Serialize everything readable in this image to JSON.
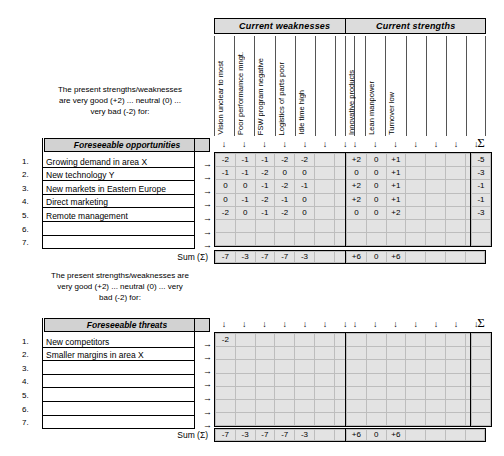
{
  "chart_data": {
    "type": "table",
    "groups": [
      {
        "name": "Current weaknesses",
        "columns": [
          "Vision unclear to most",
          "Poor performamce mngt.",
          "FSW program negative",
          "Logistics of parts  poor",
          "Idle time high",
          "",
          ""
        ],
        "column_count": 7
      },
      {
        "name": "Current strengths",
        "columns": [
          "Innovative products",
          "Lean manpower",
          "Turnover low",
          "",
          "",
          "",
          ""
        ],
        "column_count": 7
      }
    ],
    "sections": [
      {
        "key": "opportunities",
        "row_header": "Foreseeable opportunities",
        "rows": [
          "Growing demand in area X",
          "New technology Y",
          "New markets in Eastern Europe",
          "Direct marketing",
          "Remote management",
          "",
          ""
        ],
        "weaknesses_values": [
          [
            "-2",
            "-1",
            "-1",
            "-2",
            "-2",
            "",
            ""
          ],
          [
            "-1",
            "-1",
            "-2",
            "0",
            "0",
            "",
            ""
          ],
          [
            "0",
            "0",
            "-1",
            "-2",
            "-1",
            "",
            ""
          ],
          [
            "0",
            "-1",
            "-2",
            "-1",
            "0",
            "",
            ""
          ],
          [
            "-2",
            "0",
            "-1",
            "-2",
            "0",
            "",
            ""
          ],
          [
            "",
            "",
            "",
            "",
            "",
            "",
            ""
          ],
          [
            "",
            "",
            "",
            "",
            "",
            "",
            ""
          ]
        ],
        "strengths_values": [
          [
            "+2",
            "0",
            "+1",
            "",
            "",
            "",
            ""
          ],
          [
            "0",
            "0",
            "+1",
            "",
            "",
            "",
            ""
          ],
          [
            "+2",
            "0",
            "+1",
            "",
            "",
            "",
            ""
          ],
          [
            "+2",
            "0",
            "+1",
            "",
            "",
            "",
            ""
          ],
          [
            "0",
            "0",
            "+2",
            "",
            "",
            "",
            ""
          ],
          [
            "",
            "",
            "",
            "",
            "",
            "",
            ""
          ],
          [
            "",
            "",
            "",
            "",
            "",
            "",
            ""
          ]
        ],
        "row_sums": [
          "-5",
          "-3",
          "-1",
          "-1",
          "-3",
          "",
          ""
        ],
        "weaknesses_sums": [
          "-7",
          "-3",
          "-7",
          "-7",
          "-3",
          "",
          ""
        ],
        "strengths_sums": [
          "+6",
          "0",
          "+6",
          "",
          "",
          "",
          ""
        ]
      },
      {
        "key": "threats",
        "row_header": "Foreseeable threats",
        "rows": [
          "New competitors",
          "Smaller margins in area X",
          "",
          "",
          "",
          "",
          ""
        ],
        "weaknesses_values": [
          [
            "-2",
            "",
            "",
            "",
            "",
            "",
            ""
          ],
          [
            "",
            "",
            "",
            "",
            "",
            "",
            ""
          ],
          [
            "",
            "",
            "",
            "",
            "",
            "",
            ""
          ],
          [
            "",
            "",
            "",
            "",
            "",
            "",
            ""
          ],
          [
            "",
            "",
            "",
            "",
            "",
            "",
            ""
          ],
          [
            "",
            "",
            "",
            "",
            "",
            "",
            ""
          ],
          [
            "",
            "",
            "",
            "",
            "",
            "",
            ""
          ]
        ],
        "strengths_values": [
          [
            "",
            "",
            "",
            "",
            "",
            "",
            ""
          ],
          [
            "",
            "",
            "",
            "",
            "",
            "",
            ""
          ],
          [
            "",
            "",
            "",
            "",
            "",
            "",
            ""
          ],
          [
            "",
            "",
            "",
            "",
            "",
            "",
            ""
          ],
          [
            "",
            "",
            "",
            "",
            "",
            "",
            ""
          ],
          [
            "",
            "",
            "",
            "",
            "",
            "",
            ""
          ],
          [
            "",
            "",
            "",
            "",
            "",
            "",
            ""
          ]
        ],
        "row_sums": [
          "",
          "",
          "",
          "",
          "",
          "",
          ""
        ],
        "weaknesses_sums": [
          "-7",
          "-3",
          "-7",
          "-7",
          "-3",
          "",
          ""
        ],
        "strengths_sums": [
          "+6",
          "0",
          "+6",
          "",
          "",
          "",
          ""
        ]
      }
    ]
  },
  "labels": {
    "blurb_top": "The present strengths/weaknesses\nare very good (+2) ... neutral (0) ...\nvery bad (-2) for:",
    "blurb_bottom": "The present strengths/weaknesses are\nvery good (+2) ... neutral (0) ... very\nbad (-2) for:",
    "sum_label": "Sum (Σ)",
    "sigma": "Σ",
    "arrow_down": "↓",
    "arrow_right": "→",
    "list_numbers": [
      "1.",
      "2.",
      "3.",
      "4.",
      "5.",
      "6.",
      "7."
    ]
  }
}
